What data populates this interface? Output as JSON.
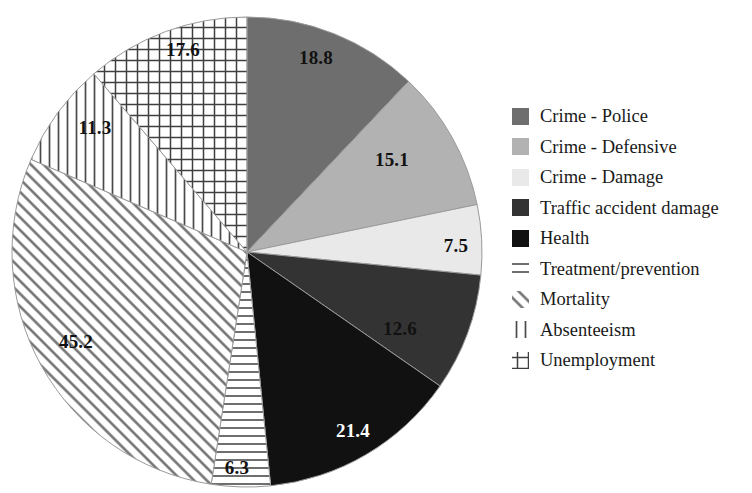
{
  "chart_data": {
    "type": "pie",
    "title": "",
    "subtitle": "",
    "xlabel": "",
    "ylabel": "",
    "legend_position": "right",
    "grid": false,
    "start_angle_deg": 0,
    "direction": "clockwise",
    "total": 155.8,
    "categories": [
      "Crime - Police",
      "Crime - Defensive",
      "Crime - Damage",
      "Traffic accident damage",
      "Health",
      "Treatment/prevention",
      "Mortality",
      "Absenteeism",
      "Unemployment"
    ],
    "values": [
      18.8,
      15.1,
      7.5,
      12.6,
      21.4,
      6.3,
      45.2,
      11.3,
      17.6
    ],
    "labels": [
      "18.8",
      "15.1",
      "7.5",
      "12.6",
      "21.4",
      "6.3",
      "45.2",
      "11.3",
      "17.6"
    ],
    "fills": [
      "#6e6e6e",
      "#b2b2b2",
      "#e9e9e9",
      "#333333",
      "#111111",
      "horizontal-lines",
      "diagonal-lines",
      "vertical-lines",
      "crosshatch-grid"
    ],
    "label_colors": [
      "#111111",
      "#111111",
      "#111111",
      "#111111",
      "#ffffff",
      "#111111",
      "#111111",
      "#111111",
      "#111111"
    ],
    "label_positions": [
      {
        "x": 316,
        "y": 64
      },
      {
        "x": 392,
        "y": 166
      },
      {
        "x": 456,
        "y": 252
      },
      {
        "x": 400,
        "y": 335
      },
      {
        "x": 353,
        "y": 437
      },
      {
        "x": 237,
        "y": 474
      },
      {
        "x": 76,
        "y": 348
      },
      {
        "x": 95,
        "y": 134
      },
      {
        "x": 183,
        "y": 56
      }
    ]
  },
  "pie": {
    "center_x": 247,
    "center_y": 252,
    "radius": 235,
    "outline_color": "#9a9a9a"
  },
  "legend": {
    "items": [
      {
        "label": "Crime - Police",
        "swatch": "solid-dark-gray-swatch",
        "color": "#6e6e6e"
      },
      {
        "label": "Crime - Defensive",
        "swatch": "solid-light-gray-swatch",
        "color": "#b2b2b2"
      },
      {
        "label": "Crime - Damage",
        "swatch": "solid-pale-gray-swatch",
        "color": "#e9e9e9"
      },
      {
        "label": "Traffic accident damage",
        "swatch": "solid-darker-gray-swatch",
        "color": "#333333"
      },
      {
        "label": "Health",
        "swatch": "solid-black-swatch",
        "color": "#111111"
      },
      {
        "label": "Treatment/prevention",
        "swatch": "horizontal-lines-swatch",
        "color": "#444444"
      },
      {
        "label": "Mortality",
        "swatch": "diagonal-lines-swatch",
        "color": "#444444"
      },
      {
        "label": "Absenteeism",
        "swatch": "vertical-lines-swatch",
        "color": "#444444"
      },
      {
        "label": "Unemployment",
        "swatch": "crosshatch-grid-swatch",
        "color": "#444444"
      }
    ]
  }
}
